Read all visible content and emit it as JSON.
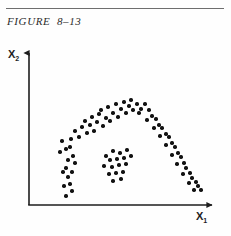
{
  "page": {
    "width": 231,
    "height": 236,
    "background": "#fefefe",
    "rule_color": "#6e6e6e"
  },
  "caption": {
    "text": "FIGURE  8–13",
    "style": "italic-serif"
  },
  "axes": {
    "x_label": "X",
    "x_sub": "1",
    "y_label": "X",
    "y_sub": "2",
    "color": "#1d1d1d",
    "origin": [
      29,
      205
    ],
    "x_end": 216,
    "y_top": 50,
    "arrowheads": true,
    "ticks": "none",
    "gridlines": "none"
  },
  "chart_data": {
    "type": "scatter",
    "title": "FIGURE  8–13",
    "xlabel": "X1",
    "ylabel": "X2",
    "grid": false,
    "legend": null,
    "dot_color": "#121212",
    "dot_size_px": 3.4,
    "xlim": [
      29,
      216
    ],
    "ylim": [
      50,
      205
    ],
    "note": "pixel coordinates, y measured downward from top of image",
    "series": [
      {
        "name": "arch-cluster",
        "description": "horseshoe / arch shaped band of points opening downward",
        "points": [
          [
            62,
            141
          ],
          [
            66,
            149
          ],
          [
            60,
            152
          ],
          [
            71,
            139
          ],
          [
            70,
            147
          ],
          [
            75,
            131
          ],
          [
            79,
            137
          ],
          [
            73,
            156
          ],
          [
            68,
            160
          ],
          [
            75,
            163
          ],
          [
            66,
            168
          ],
          [
            72,
            172
          ],
          [
            68,
            177
          ],
          [
            63,
            172
          ],
          [
            70,
            184
          ],
          [
            64,
            186
          ],
          [
            72,
            191
          ],
          [
            66,
            196
          ],
          [
            82,
            127
          ],
          [
            87,
            133
          ],
          [
            90,
            125
          ],
          [
            85,
            121
          ],
          [
            94,
            131
          ],
          [
            97,
            122
          ],
          [
            92,
            117
          ],
          [
            99,
            114
          ],
          [
            103,
            126
          ],
          [
            106,
            118
          ],
          [
            101,
            110
          ],
          [
            110,
            121
          ],
          [
            113,
            113
          ],
          [
            108,
            107
          ],
          [
            118,
            117
          ],
          [
            121,
            109
          ],
          [
            116,
            104
          ],
          [
            126,
            113
          ],
          [
            129,
            106
          ],
          [
            124,
            102
          ],
          [
            133,
            110
          ],
          [
            137,
            104
          ],
          [
            131,
            100
          ],
          [
            141,
            109
          ],
          [
            145,
            104
          ],
          [
            139,
            113
          ],
          [
            149,
            110
          ],
          [
            152,
            116
          ],
          [
            147,
            120
          ],
          [
            156,
            119
          ],
          [
            159,
            125
          ],
          [
            154,
            128
          ],
          [
            162,
            128
          ],
          [
            166,
            134
          ],
          [
            160,
            136
          ],
          [
            169,
            137
          ],
          [
            172,
            143
          ],
          [
            166,
            145
          ],
          [
            175,
            147
          ],
          [
            178,
            153
          ],
          [
            172,
            155
          ],
          [
            181,
            157
          ],
          [
            184,
            163
          ],
          [
            177,
            164
          ],
          [
            186,
            168
          ],
          [
            190,
            173
          ],
          [
            183,
            174
          ],
          [
            192,
            178
          ],
          [
            196,
            182
          ],
          [
            189,
            183
          ],
          [
            198,
            186
          ],
          [
            201,
            190
          ],
          [
            194,
            190
          ]
        ]
      },
      {
        "name": "central-blob",
        "description": "dense compact cluster in the interior of the arch",
        "points": [
          [
            106,
            156
          ],
          [
            113,
            151
          ],
          [
            120,
            153
          ],
          [
            127,
            150
          ],
          [
            110,
            160
          ],
          [
            117,
            159
          ],
          [
            124,
            158
          ],
          [
            131,
            156
          ],
          [
            104,
            166
          ],
          [
            112,
            167
          ],
          [
            119,
            165
          ],
          [
            126,
            164
          ],
          [
            109,
            174
          ],
          [
            116,
            173
          ],
          [
            123,
            172
          ],
          [
            113,
            181
          ],
          [
            121,
            179
          ]
        ]
      }
    ]
  }
}
